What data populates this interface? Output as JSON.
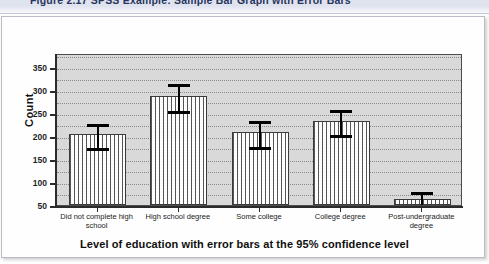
{
  "caption": {
    "text": "Figure 2.17    SPSS Example: Sample Bar Graph with Error Bars"
  },
  "chart_data": {
    "type": "bar",
    "title": "",
    "xlabel": "Level of education with error bars at the 95% confidence level",
    "ylabel": "Count",
    "categories": [
      "Did not complete high school",
      "High school degree",
      "Some college",
      "College degree",
      "Post-undergraduate degree"
    ],
    "values": [
      204,
      287,
      209,
      232,
      64
    ],
    "error_upper": [
      230,
      318,
      236,
      261,
      82
    ],
    "error_lower": [
      178,
      258,
      181,
      207,
      50
    ],
    "error_label": "95% confidence interval",
    "ylim": [
      50,
      380
    ],
    "yticks": [
      50,
      100,
      150,
      200,
      250,
      300,
      350
    ],
    "ytick_labels": [
      "50",
      "100",
      "150",
      "200",
      "250",
      "300",
      "350"
    ],
    "grid": true,
    "grid_style": "dotted-horizontal",
    "legend": "none",
    "colors": {
      "bar_fill": "#fbfbfb",
      "bar_edge": "#3a3a3a",
      "plot_background": "#d9d9d9",
      "error_bar": "#000000",
      "axis": "#2b2b2b",
      "caption_band": "#dfe3ee",
      "caption_text": "#27355e"
    }
  }
}
